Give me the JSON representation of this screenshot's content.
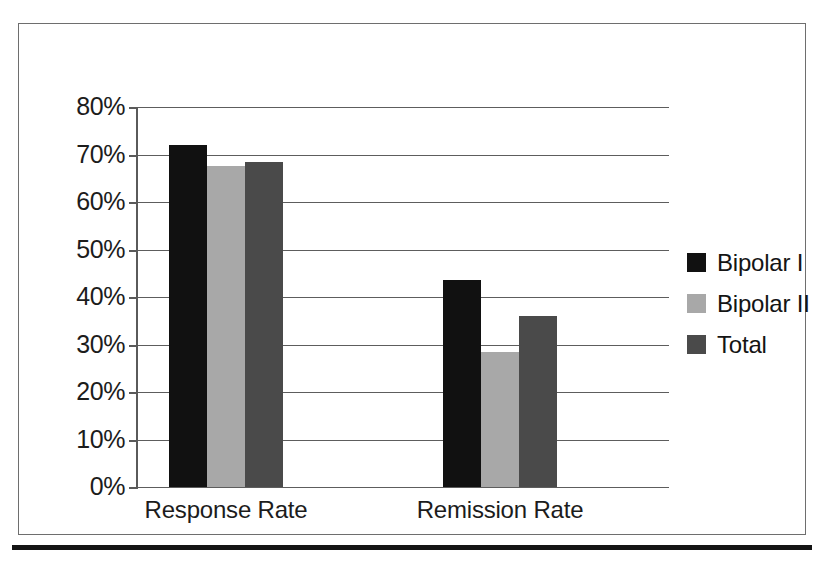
{
  "chart_data": {
    "type": "bar",
    "title": "",
    "xlabel": "",
    "ylabel": "",
    "categories": [
      "Response Rate",
      "Remission Rate"
    ],
    "series": [
      {
        "name": "Bipolar I",
        "color": "#111111",
        "values": [
          72,
          43.5
        ]
      },
      {
        "name": "Bipolar II",
        "color": "#a8a8a8",
        "values": [
          67.5,
          28.5
        ]
      },
      {
        "name": "Total",
        "color": "#4a4a4a",
        "values": [
          68.5,
          36
        ]
      }
    ],
    "ylim": [
      0,
      80
    ],
    "ytick_labels": [
      "80%",
      "70%",
      "60%",
      "50%",
      "40%",
      "30%",
      "20%",
      "10%",
      "0%"
    ],
    "ytick_values": [
      80,
      70,
      60,
      50,
      40,
      30,
      20,
      10,
      0
    ],
    "value_format": "percent",
    "grid": true,
    "legend_position": "right"
  },
  "legend": {
    "entries": [
      {
        "label": "Bipolar I"
      },
      {
        "label": "Bipolar II"
      },
      {
        "label": "Total"
      }
    ]
  }
}
